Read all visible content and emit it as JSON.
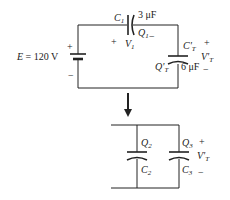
{
  "diagram": {
    "type": "circuit",
    "top_circuit": {
      "source": {
        "label": "E = 120 V",
        "plus": "+",
        "minus": "−"
      },
      "c1": {
        "name": "C",
        "sub": "1",
        "value": "3 μF",
        "charge": "Q",
        "charge_sub": "1",
        "charge_sign": "−",
        "voltage": "V",
        "voltage_sub": "1",
        "voltage_sign": "+"
      },
      "ct": {
        "name": "C'",
        "sub": "T",
        "value": "6 μF",
        "charge": "Q'",
        "charge_sub": "T",
        "voltage": "V'",
        "voltage_sub": "T",
        "plus": "+",
        "minus": "−"
      }
    },
    "arrow": "down-arrow",
    "bottom_circuit": {
      "c2": {
        "charge": "Q",
        "charge_sub": "2",
        "name": "C",
        "sub": "2"
      },
      "c3": {
        "charge": "Q",
        "charge_sub": "3",
        "name": "C",
        "sub": "3"
      },
      "voltage": {
        "label": "V'",
        "sub": "T",
        "plus": "+",
        "minus": "−"
      }
    }
  }
}
